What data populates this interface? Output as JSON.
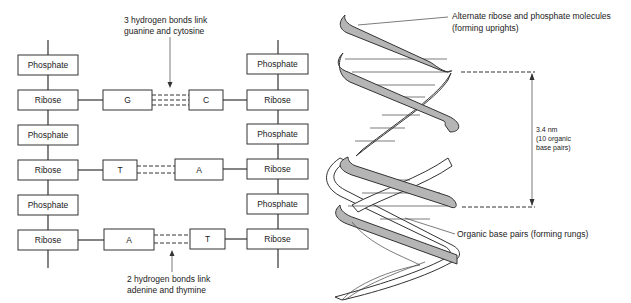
{
  "ladder": {
    "left_column": [
      {
        "type": "phosphate",
        "label": "Phosphate"
      },
      {
        "type": "ribose",
        "label": "Ribose"
      },
      {
        "type": "phosphate",
        "label": "Phosphate"
      },
      {
        "type": "ribose",
        "label": "Ribose"
      },
      {
        "type": "phosphate",
        "label": "Phosphate"
      },
      {
        "type": "ribose",
        "label": "Ribose"
      }
    ],
    "right_column": [
      {
        "type": "phosphate",
        "label": "Phosphate"
      },
      {
        "type": "ribose",
        "label": "Ribose"
      },
      {
        "type": "phosphate",
        "label": "Phosphate"
      },
      {
        "type": "ribose",
        "label": "Ribose"
      },
      {
        "type": "phosphate",
        "label": "Phosphate"
      },
      {
        "type": "ribose",
        "label": "Ribose"
      }
    ],
    "base_pairs": [
      {
        "left": "G",
        "right": "C",
        "hydrogen_bonds": 3
      },
      {
        "left": "T",
        "right": "A",
        "hydrogen_bonds": 2
      },
      {
        "left": "A",
        "right": "T",
        "hydrogen_bonds": 2
      }
    ],
    "annotation_top": {
      "line1": "3 hydrogen bonds link",
      "line2": "guanine and cytosine"
    },
    "annotation_bottom": {
      "line1": "2 hydrogen bonds link",
      "line2": "adenine and thymine"
    }
  },
  "helix": {
    "uprights_label": {
      "line1": "Alternate ribose and phosphate molecules",
      "line2": "(forming uprights)"
    },
    "rungs_label": "Organic base pairs (forming rungs)",
    "pitch_label": {
      "line1": "3.4 nm",
      "line2": "(10 organic",
      "line3": "base pairs)"
    }
  }
}
